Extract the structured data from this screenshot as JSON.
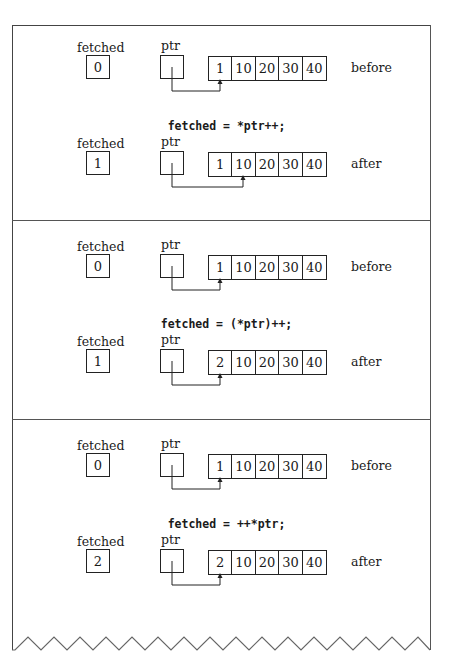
{
  "labels": {
    "fetched": "fetched",
    "ptr": "ptr",
    "before": "before",
    "after": "after"
  },
  "panels": [
    {
      "statement": "fetched = *ptr++;",
      "before": {
        "fetched": "0",
        "array": [
          "1",
          "10",
          "20",
          "30",
          "40"
        ],
        "ptr_index": 0
      },
      "after": {
        "fetched": "1",
        "array": [
          "1",
          "10",
          "20",
          "30",
          "40"
        ],
        "ptr_index": 1
      }
    },
    {
      "statement": "fetched = (*ptr)++;",
      "before": {
        "fetched": "0",
        "array": [
          "1",
          "10",
          "20",
          "30",
          "40"
        ],
        "ptr_index": 0
      },
      "after": {
        "fetched": "1",
        "array": [
          "2",
          "10",
          "20",
          "30",
          "40"
        ],
        "ptr_index": 0
      }
    },
    {
      "statement": "fetched = ++*ptr;",
      "before": {
        "fetched": "0",
        "array": [
          "1",
          "10",
          "20",
          "30",
          "40"
        ],
        "ptr_index": 0
      },
      "after": {
        "fetched": "2",
        "array": [
          "2",
          "10",
          "20",
          "30",
          "40"
        ],
        "ptr_index": 0
      }
    }
  ],
  "colors": {
    "line": "#222222",
    "frame": "#444444",
    "background": "#ffffff"
  }
}
